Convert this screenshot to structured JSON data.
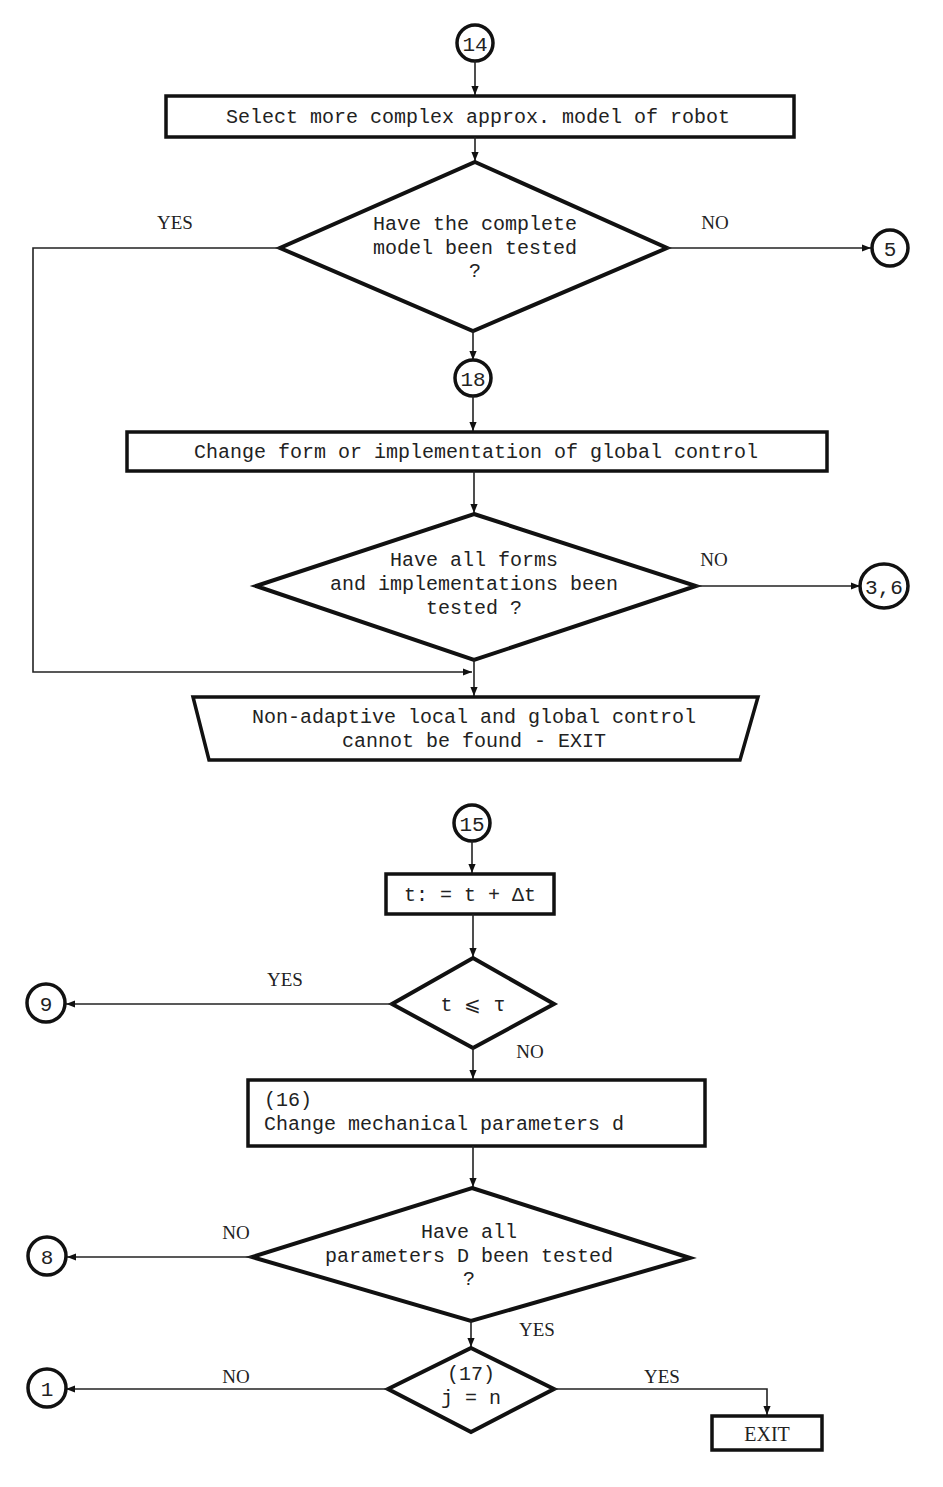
{
  "diagram": {
    "type": "flowchart",
    "top_section": {
      "entry_connector": "14",
      "process_select_model": "Select more complex approx. model of robot",
      "decision_complete_model": {
        "lines": [
          "Have the complete",
          "model been tested",
          "?"
        ],
        "yes_label": "YES",
        "no_label": "NO",
        "no_target": "5"
      },
      "connector_18": "18",
      "process_change_form": "Change form or implementation of global control",
      "decision_all_forms": {
        "lines": [
          "Have all forms",
          "and implementations been",
          "tested ?"
        ],
        "no_label": "NO",
        "no_target": "3,6"
      },
      "terminal_exit": {
        "lines": [
          "Non-adaptive local and global control",
          "cannot be found - EXIT"
        ]
      }
    },
    "bottom_section": {
      "entry_connector": "15",
      "process_time_step": "t: = t + Δt",
      "decision_time": {
        "text": "t ⩽ τ",
        "yes_label": "YES",
        "yes_target": "9",
        "no_label": "NO"
      },
      "process_change_params": {
        "lines": [
          "(16)",
          "Change mechanical parameters d"
        ]
      },
      "decision_all_params": {
        "lines": [
          "Have all",
          "parameters D been tested",
          "?"
        ],
        "no_label": "NO",
        "no_target": "8",
        "yes_label": "YES"
      },
      "decision_j": {
        "lines": [
          "(17)",
          "j = n"
        ],
        "no_label": "NO",
        "no_target": "1",
        "yes_label": "YES"
      },
      "exit_box": "EXIT"
    },
    "colors": {
      "ink": "#111111",
      "background": "#ffffff"
    }
  }
}
